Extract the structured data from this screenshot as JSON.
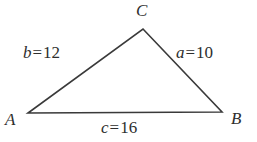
{
  "figure": {
    "kind": "triangle-diagram",
    "stroke_color": "#3a3a3a",
    "background_color": "#ffffff",
    "text_color": "#2e2e2e"
  },
  "vertices": [
    {
      "key": "A",
      "label": "A",
      "x": 28,
      "y": 113
    },
    {
      "key": "B",
      "label": "B",
      "x": 222,
      "y": 112
    },
    {
      "key": "C",
      "label": "C",
      "x": 143,
      "y": 29
    }
  ],
  "sides": [
    {
      "key": "a",
      "symbol": "a",
      "equals": "=",
      "value": "10",
      "full": "a = 10",
      "between": "C-B"
    },
    {
      "key": "b",
      "symbol": "b",
      "equals": "=",
      "value": "12",
      "full": "b = 12",
      "between": "A-C"
    },
    {
      "key": "c",
      "symbol": "c",
      "equals": "=",
      "value": "16",
      "full": "c = 16",
      "between": "A-B"
    }
  ]
}
